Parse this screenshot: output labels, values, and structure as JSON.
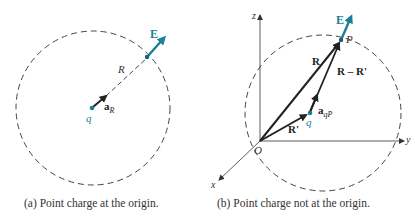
{
  "colors": {
    "accent": "#1b7f98",
    "vector": "#222222",
    "dashed": "#444444"
  },
  "panel_a": {
    "caption": "(a) Point charge at the origin.",
    "labels": {
      "field": "E",
      "radius": "R",
      "unit_vector": "a",
      "unit_vector_sub": "R",
      "charge": "q"
    }
  },
  "panel_b": {
    "caption": "(b) Point charge not at the origin.",
    "labels": {
      "field": "E",
      "point": "P",
      "vector_R": "R",
      "vector_diff": "R – R'",
      "vector_Rprime": "R'",
      "unit_vector": "a",
      "unit_vector_sub": "qP",
      "charge": "q",
      "origin": "O",
      "axis_x": "x",
      "axis_y": "y",
      "axis_z": "z"
    }
  }
}
